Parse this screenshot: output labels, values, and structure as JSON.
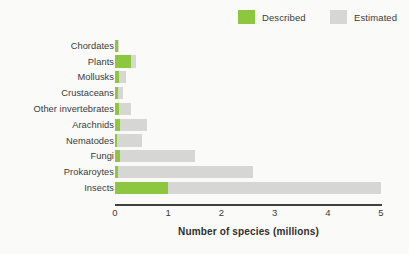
{
  "legend": {
    "position": "top-right",
    "items": [
      {
        "label": "Described",
        "color": "#8dc63f",
        "key": "described"
      },
      {
        "label": "Estimated",
        "color": "#d6d6d4",
        "key": "estimated"
      }
    ]
  },
  "axis": {
    "title": "Number of species (millions)",
    "ticks": [
      "0",
      "1",
      "2",
      "3",
      "4",
      "5"
    ]
  },
  "colors": {
    "described": "#8dc63f",
    "estimated": "#d6d6d4",
    "background": "#fafaf8",
    "axis": "#3f3f3d",
    "text": "#3b3b39"
  },
  "chart_data": {
    "type": "bar",
    "orientation": "horizontal",
    "overlap": true,
    "title": "",
    "subtitle": "",
    "xlabel": "Number of species (millions)",
    "ylabel": "",
    "xlim": [
      0,
      5
    ],
    "xticks": [
      0,
      1,
      2,
      3,
      4,
      5
    ],
    "grid": false,
    "legend_position": "top-right",
    "categories": [
      "Chordates",
      "Plants",
      "Mollusks",
      "Crustaceans",
      "Other invertebrates",
      "Arachnids",
      "Nematodes",
      "Fungi",
      "Prokaroytes",
      "Insects"
    ],
    "series": [
      {
        "name": "Described",
        "color": "#8dc63f",
        "values": [
          0.06,
          0.3,
          0.08,
          0.05,
          0.08,
          0.1,
          0.03,
          0.1,
          0.05,
          1.0
        ]
      },
      {
        "name": "Estimated",
        "color": "#d6d6d4",
        "values": [
          0.08,
          0.4,
          0.2,
          0.15,
          0.3,
          0.6,
          0.5,
          1.5,
          2.6,
          5.0
        ]
      }
    ]
  }
}
